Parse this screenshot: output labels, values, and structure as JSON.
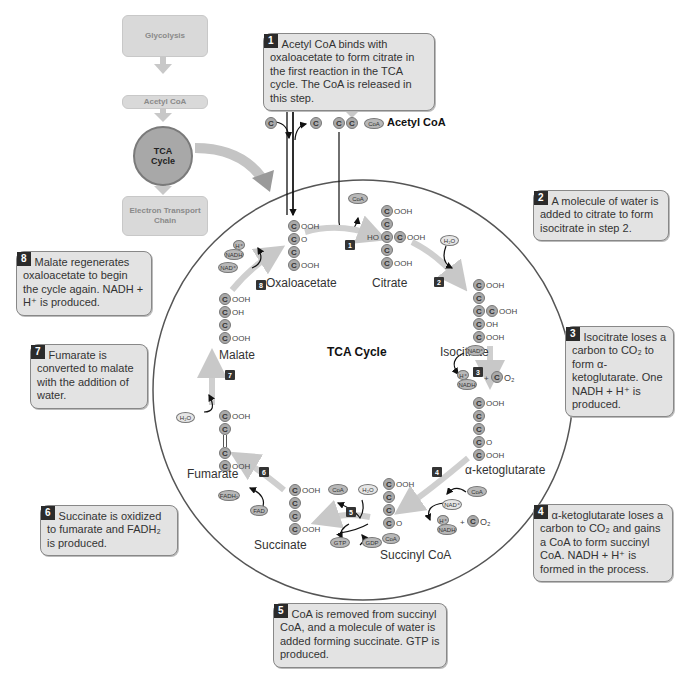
{
  "overview_flow": {
    "glycolysis": "Glycolysis",
    "acetyl_coa": "Acetyl CoA",
    "tca_cycle": "TCA Cycle",
    "etc": "Electron Transport Chain"
  },
  "center_title": "TCA Cycle",
  "inputs": {
    "pyruvate_label": "Pyruvate",
    "acetyl_coa_label": "Acetyl CoA",
    "coa": "CoA",
    "carbon": "C"
  },
  "molecules": [
    {
      "name": "Oxaloacetate",
      "groups": [
        "OOH",
        "O",
        "",
        "OOH"
      ]
    },
    {
      "name": "Citrate",
      "groups": [
        "OOH",
        "",
        "HO C COOH",
        "",
        "OOH"
      ]
    },
    {
      "name": "Isocitrate",
      "groups": [
        "OOH",
        "",
        "C OOH",
        "OH",
        "OOH"
      ]
    },
    {
      "name": "α-ketoglutarate",
      "groups": [
        "OOH",
        "",
        "",
        "O",
        "OOH"
      ]
    },
    {
      "name": "Succinyl CoA",
      "groups": [
        "OOH",
        "",
        "",
        "O",
        "CoA"
      ]
    },
    {
      "name": "Succinate",
      "groups": [
        "OOH",
        "",
        "",
        "OOH"
      ]
    },
    {
      "name": "Fumarate",
      "groups": [
        "OOH",
        "",
        "",
        "OOH"
      ]
    },
    {
      "name": "Malate",
      "groups": [
        "OOH",
        "OH",
        "",
        "OOH"
      ]
    }
  ],
  "cofactors": {
    "h2o": "H₂O",
    "nad": "NAD⁺",
    "nadh": "NADH",
    "h_plus": "H⁺",
    "co2_c": "C",
    "co2_o": "O₂",
    "coa": "CoA",
    "fad": "FAD",
    "fadh2": "FADH₂",
    "gtp": "GTP",
    "gdp": "GDP",
    "plus": "+"
  },
  "steps": [
    "1",
    "2",
    "3",
    "4",
    "5",
    "6",
    "7",
    "8"
  ],
  "callouts": [
    {
      "num": "1",
      "text": "Acetyl CoA binds with oxaloacetate to form citrate in the first reaction in the TCA cycle. The CoA is released in this step."
    },
    {
      "num": "2",
      "text": "A molecule of water is added to citrate to form isocitrate in step 2."
    },
    {
      "num": "3",
      "text": "Isocitrate loses a carbon to CO₂ to form α-ketoglutarate. One NADH + H⁺ is produced."
    },
    {
      "num": "4",
      "text": "α-ketoglutarate loses a carbon to CO₂ and gains a CoA to form succinyl CoA. NADH + H⁺ is formed in the process."
    },
    {
      "num": "5",
      "text": "CoA is removed from succinyl CoA, and a molecule of water is added forming succinate. GTP is produced."
    },
    {
      "num": "6",
      "text": "Succinate is oxidized to fumarate and FADH₂ is produced."
    },
    {
      "num": "7",
      "text": "Fumarate is converted to malate with the addition of water."
    },
    {
      "num": "8",
      "text": "Malate regenerates oxaloacetate to begin the cycle again. NADH + H⁺ is produced."
    }
  ]
}
